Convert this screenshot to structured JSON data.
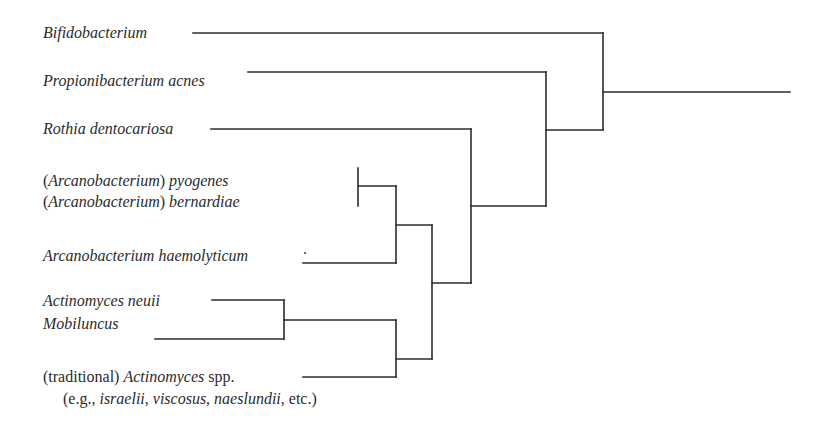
{
  "diagram": {
    "type": "phylogenetic-tree",
    "taxa": [
      {
        "id": "bifidobacterium",
        "parts": [
          {
            "text": "Bifidobacterium",
            "italic": true
          }
        ]
      },
      {
        "id": "propionibacterium",
        "parts": [
          {
            "text": "Propionibacterium acnes",
            "italic": true
          }
        ]
      },
      {
        "id": "rothia",
        "parts": [
          {
            "text": "Rothia dentocariosa",
            "italic": true
          }
        ]
      },
      {
        "id": "arcano-pyogenes",
        "parts": [
          {
            "text": "(",
            "italic": false
          },
          {
            "text": "Arcanobacterium",
            "italic": true
          },
          {
            "text": ") ",
            "italic": false
          },
          {
            "text": "pyogenes",
            "italic": true
          }
        ]
      },
      {
        "id": "arcano-bernardiae",
        "parts": [
          {
            "text": "(",
            "italic": false
          },
          {
            "text": "Arcanobacterium",
            "italic": true
          },
          {
            "text": ") ",
            "italic": false
          },
          {
            "text": "bernardiae",
            "italic": true
          }
        ]
      },
      {
        "id": "arcano-haemolyticum",
        "parts": [
          {
            "text": "Arcanobacterium haemolyticum",
            "italic": true
          }
        ]
      },
      {
        "id": "actinomyces-neuii",
        "parts": [
          {
            "text": "Actinomyces neuii",
            "italic": true
          }
        ]
      },
      {
        "id": "mobiluncus",
        "parts": [
          {
            "text": "Mobiluncus",
            "italic": true
          }
        ]
      },
      {
        "id": "traditional-actinomyces",
        "parts": [
          {
            "text": "(traditional) ",
            "italic": false
          },
          {
            "text": "Actinomyces",
            "italic": true
          },
          {
            "text": " spp.",
            "italic": false
          }
        ]
      },
      {
        "id": "traditional-actinomyces-examples",
        "parts": [
          {
            "text": "(e.g., ",
            "italic": false
          },
          {
            "text": "israelii",
            "italic": true
          },
          {
            "text": ", ",
            "italic": false
          },
          {
            "text": "viscosus",
            "italic": true
          },
          {
            "text": ", ",
            "italic": false
          },
          {
            "text": "naeslundii",
            "italic": true
          },
          {
            "text": ", etc.)",
            "italic": false
          }
        ]
      }
    ],
    "labels": {
      "bifidobacterium": "Bifidobacterium",
      "propionibacterium": "Propionibacterium acnes",
      "rothia": "Rothia dentocariosa",
      "pyogenes_genus": "Arcanobacterium",
      "pyogenes_species": "pyogenes",
      "bernardiae_genus": "Arcanobacterium",
      "bernardiae_species": "bernardiae",
      "haemolyticum": "Arcanobacterium haemolyticum",
      "neuii": "Actinomyces neuii",
      "mobiluncus": "Mobiluncus",
      "traditional_prefix": "(traditional) ",
      "traditional_genus": "Actinomyces",
      "traditional_suffix": " spp.",
      "examples_open": "(e.g., ",
      "examples_1": "israelii",
      "sep_1": ", ",
      "examples_2": "viscosus",
      "sep_2": ", ",
      "examples_3": "naeslundii",
      "examples_close": ", etc.)",
      "paren_open": "(",
      "paren_close": ") "
    },
    "topology": "((Bifidobacterium),((Propionibacterium acnes),((Rothia dentocariosa),((((Arcanobacterium) pyogenes,(Arcanobacterium) bernardiae),Arcanobacterium haemolyticum),((Actinomyces neuii,Mobiluncus),(traditional) Actinomyces spp.)))))",
    "line_color": "#2c2c2c"
  }
}
